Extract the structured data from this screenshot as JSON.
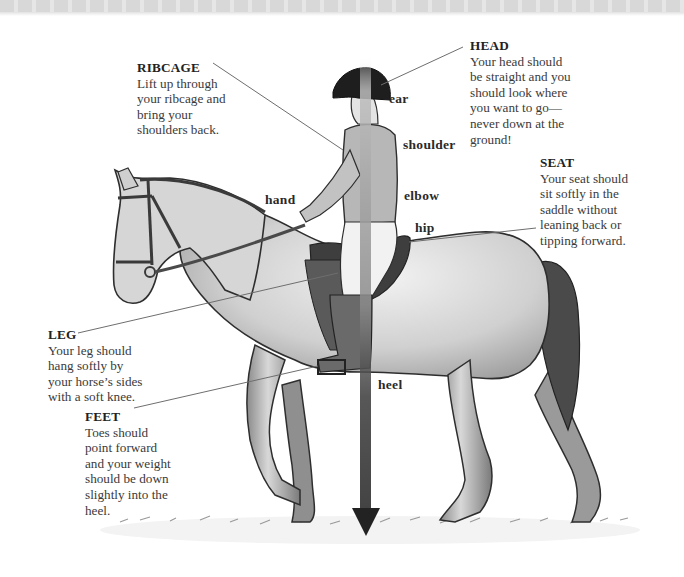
{
  "diagram": {
    "callouts": {
      "ribcage": {
        "title": "RIBCAGE",
        "body": "Lift up through\nyour ribcage and\nbring your\nshoulders back."
      },
      "head": {
        "title": "HEAD",
        "body": "Your head should\nbe straight and you\nshould look where\nyou want to go—\nnever down at the\nground!"
      },
      "seat": {
        "title": "SEAT",
        "body": "Your seat should\nsit softly in the\nsaddle without\nleaning back or\ntipping forward."
      },
      "leg": {
        "title": "LEG",
        "body": "Your leg should\nhang softly by\nyour horse’s sides\nwith a soft knee."
      },
      "feet": {
        "title": "FEET",
        "body": "Toes should\npoint forward\nand your weight\nshould be down\nslightly into the\nheel."
      }
    },
    "alignment_labels": {
      "ear": "ear",
      "shoulder": "shoulder",
      "elbow": "elbow",
      "hip": "hip",
      "heel": "heel",
      "hand": "hand"
    },
    "colors": {
      "alignment_arrow": "#2b2b2b",
      "leader_line": "#6e6e6e",
      "horse_body": "#cfcfcf",
      "horse_outline": "#2e2e2e",
      "tail": "#4a4a4a",
      "helmet": "#1e1e1e"
    }
  }
}
